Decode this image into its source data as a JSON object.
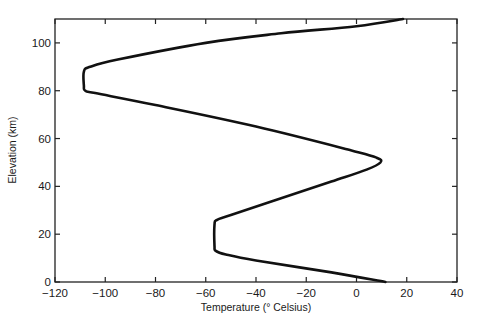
{
  "chart_data": {
    "type": "line",
    "title": "",
    "xlabel": "Temperature (° Celsius)",
    "ylabel": "Elevation (km)",
    "xlim": [
      -120,
      40
    ],
    "ylim": [
      0,
      110
    ],
    "x_ticks": [
      -120,
      -100,
      -80,
      -60,
      -40,
      -20,
      0,
      20,
      40
    ],
    "x_tick_labels": [
      "−120",
      "−100",
      "−80",
      "−60",
      "−40",
      "−20",
      "0",
      "20",
      "40"
    ],
    "y_ticks": [
      0,
      20,
      40,
      60,
      80,
      100
    ],
    "y_tick_labels": [
      "0",
      "20",
      "40",
      "60",
      "80",
      "100"
    ],
    "grid": false,
    "legend": null,
    "series": [
      {
        "name": "Atmospheric temperature profile",
        "color": "#111111",
        "points": [
          {
            "x": 11.5,
            "y": 0
          },
          {
            "x": -10,
            "y": 4
          },
          {
            "x": -40,
            "y": 9
          },
          {
            "x": -52,
            "y": 11.5
          },
          {
            "x": -56,
            "y": 13
          },
          {
            "x": -56.5,
            "y": 15
          },
          {
            "x": -56.5,
            "y": 24
          },
          {
            "x": -55.5,
            "y": 26
          },
          {
            "x": -50,
            "y": 28
          },
          {
            "x": -30,
            "y": 35
          },
          {
            "x": -10,
            "y": 42
          },
          {
            "x": 4,
            "y": 47
          },
          {
            "x": 9.5,
            "y": 50
          },
          {
            "x": 8,
            "y": 52
          },
          {
            "x": -2,
            "y": 55
          },
          {
            "x": -40,
            "y": 65
          },
          {
            "x": -80,
            "y": 74
          },
          {
            "x": -104,
            "y": 79
          },
          {
            "x": -108,
            "y": 80
          },
          {
            "x": -108.5,
            "y": 82
          },
          {
            "x": -108.5,
            "y": 88
          },
          {
            "x": -106,
            "y": 90
          },
          {
            "x": -95,
            "y": 93
          },
          {
            "x": -60,
            "y": 100
          },
          {
            "x": -30,
            "y": 104
          },
          {
            "x": 0,
            "y": 107
          },
          {
            "x": 18.5,
            "y": 110
          }
        ]
      }
    ]
  }
}
